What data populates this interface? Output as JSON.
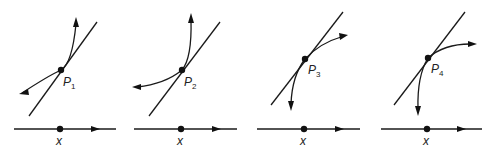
{
  "figure": {
    "colors": {
      "ink": "#1a1a1a",
      "background": "#ffffff"
    },
    "panels": [
      {
        "point_label": "P",
        "point_subscript": "1",
        "axis_label": "x"
      },
      {
        "point_label": "P",
        "point_subscript": "2",
        "axis_label": "x"
      },
      {
        "point_label": "P",
        "point_subscript": "3",
        "axis_label": "x"
      },
      {
        "point_label": "P",
        "point_subscript": "4",
        "axis_label": "x"
      }
    ]
  }
}
